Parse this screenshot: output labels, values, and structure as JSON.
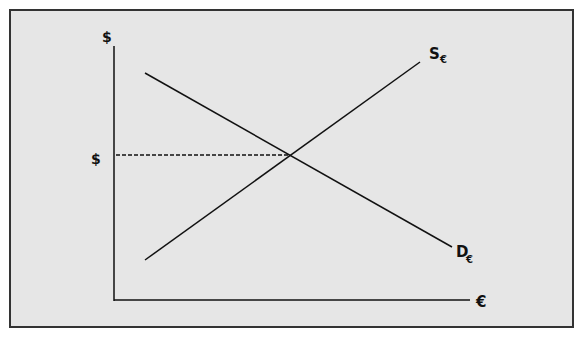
{
  "diagram": {
    "type": "supply-demand",
    "title": "",
    "y_axis_label": "$",
    "x_axis_label": "€",
    "price_label": "$",
    "curves": [
      {
        "name": "supply",
        "label": "S",
        "subscript": "€",
        "from": [
          145,
          260
        ],
        "to": [
          420,
          62
        ]
      },
      {
        "name": "demand",
        "label": "D",
        "subscript": "€",
        "from": [
          145,
          73
        ],
        "to": [
          452,
          247
        ]
      }
    ],
    "equilibrium": {
      "x": 289,
      "y": 155
    },
    "colors": {
      "background": "#e6e6e6",
      "line": "#111111",
      "frame": "#333333"
    }
  }
}
